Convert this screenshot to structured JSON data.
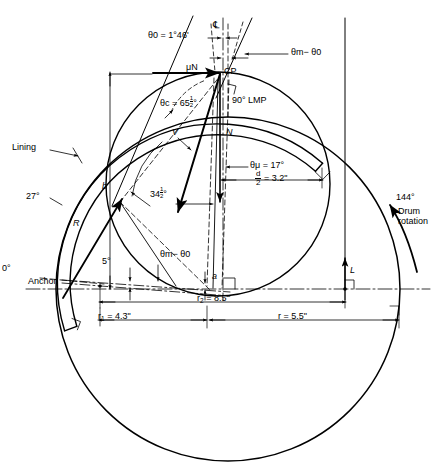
{
  "diagram": {
    "ink_color": "#000000",
    "background": "#ffffff"
  },
  "labels": {
    "theta0": "θ0 = 1°46'",
    "theta_m_minus_theta0_top": "θm− θ0",
    "theta_m_minus_theta0_bottom": "θm− θ0",
    "mu_n": "μN",
    "cp": "CP",
    "centerline_mark": "℄",
    "theta_c": "θc = 65",
    "theta_c_half": "1/2",
    "theta_c_deg": "°",
    "lmp": "90° LMP",
    "force_v": "V",
    "force_n": "N",
    "theta_mu": "θμ = 17°",
    "half_d_num": "d",
    "half_d_den": "2",
    "half_d_value": "= 3.2\"",
    "lining": "Lining",
    "angle_27": "27°",
    "angle_144": "144°",
    "dim_b": "b",
    "force_r": "R",
    "angle_34half_pre": "34",
    "angle_34half_frac": "1/2",
    "angle_34half_deg": "°",
    "angle_0": "0°",
    "anchor": "Anchor",
    "angle_5": "5°",
    "dim_a": "a",
    "r1": "r1 = 4.3\"",
    "r2": "r2 = 8.5\"",
    "r": "r = 5.5\"",
    "force_l": "L",
    "drum_rotation_line1": "Drum",
    "drum_rotation_line2": "rotation"
  },
  "values": {
    "theta0_deg": 1.766,
    "theta_c_deg": 65.5,
    "theta_mu_deg": 17,
    "angle_27_deg": 27,
    "angle_144_deg": 144,
    "angle_34half_deg": 34.5,
    "angle_5_deg": 5,
    "lmp_deg": 90,
    "half_d_in": 3.2,
    "r1_in": 4.3,
    "r2_in": 8.5,
    "r_in": 5.5
  },
  "geometry": {
    "drum_center_x": 228,
    "drum_center_y": 289,
    "drum_radius": 172,
    "shoe_center_x": 218,
    "shoe_center_y": 184,
    "shoe_radius": 112,
    "lining_inner_radius": 148,
    "lining_outer_radius": 160,
    "cp_x": 220,
    "cp_y": 73,
    "anchor_x": 100,
    "anchor_y": 286
  }
}
